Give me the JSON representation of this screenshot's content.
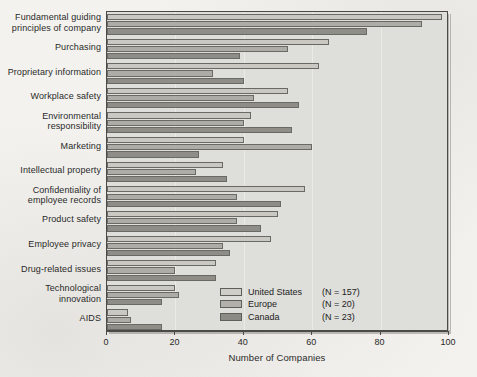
{
  "chart_data": {
    "type": "bar",
    "orientation": "horizontal",
    "title": "",
    "xlabel": "Number of Companies",
    "ylabel": "",
    "xlim": [
      0,
      100
    ],
    "xticks": [
      0,
      20,
      40,
      60,
      80,
      100
    ],
    "grid": true,
    "grid_axis": "x",
    "legend_position": "lower right",
    "categories": [
      "Fundamental guiding principles of company",
      "Purchasing",
      "Proprietary information",
      "Workplace safety",
      "Environmental responsibility",
      "Marketing",
      "Intellectual property",
      "Confidentiality of employee records",
      "Product safety",
      "Employee privacy",
      "Drug-related issues",
      "Technological innovation",
      "AIDS"
    ],
    "category_lines": [
      [
        "Fundamental guiding",
        "principles of company"
      ],
      [
        "Purchasing"
      ],
      [
        "Proprietary information"
      ],
      [
        "Workplace safety"
      ],
      [
        "Environmental",
        "responsibility"
      ],
      [
        "Marketing"
      ],
      [
        "Intellectual property"
      ],
      [
        "Confidentiality of",
        "employee records"
      ],
      [
        "Product safety"
      ],
      [
        "Employee privacy"
      ],
      [
        "Drug-related issues"
      ],
      [
        "Technological",
        "innovation"
      ],
      [
        "AIDS"
      ]
    ],
    "series": [
      {
        "name": "United States",
        "n_label": "(N = 157)",
        "color": "#c9c8c2",
        "values": [
          98,
          65,
          62,
          53,
          42,
          40,
          34,
          58,
          50,
          48,
          32,
          20,
          6
        ]
      },
      {
        "name": "Europe",
        "n_label": "(N = 20)",
        "color": "#adaca6",
        "values": [
          92,
          53,
          31,
          43,
          40,
          60,
          26,
          38,
          38,
          34,
          20,
          21,
          7
        ]
      },
      {
        "name": "Canada",
        "n_label": "(N = 23)",
        "color": "#8e8d87",
        "values": [
          76,
          39,
          40,
          56,
          54,
          27,
          35,
          51,
          45,
          36,
          32,
          16,
          16
        ]
      }
    ]
  },
  "legend": {
    "items": [
      {
        "label": "United States",
        "count": "(N = 157)"
      },
      {
        "label": "Europe",
        "count": "(N = 20)"
      },
      {
        "label": "Canada",
        "count": "(N = 23)"
      }
    ]
  },
  "axis": {
    "x_title": "Number of Companies",
    "tick_labels": [
      "0",
      "20",
      "40",
      "60",
      "80",
      "100"
    ]
  }
}
